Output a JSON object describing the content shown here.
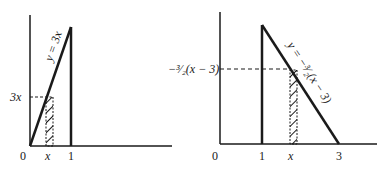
{
  "figures": [
    {
      "id": "left",
      "curve_label": "y = 3x",
      "dashed_label": "3x",
      "ticks": [
        "0",
        "x",
        "1"
      ]
    },
    {
      "id": "right",
      "curve_label": "y = −³⁄₂(x − 3)",
      "dashed_label": "−³⁄₂(x − 3)",
      "ticks": [
        "0",
        "1",
        "x",
        "3"
      ]
    }
  ],
  "colors": {
    "ink": "#1a1a1a",
    "background": "#ffffff"
  }
}
